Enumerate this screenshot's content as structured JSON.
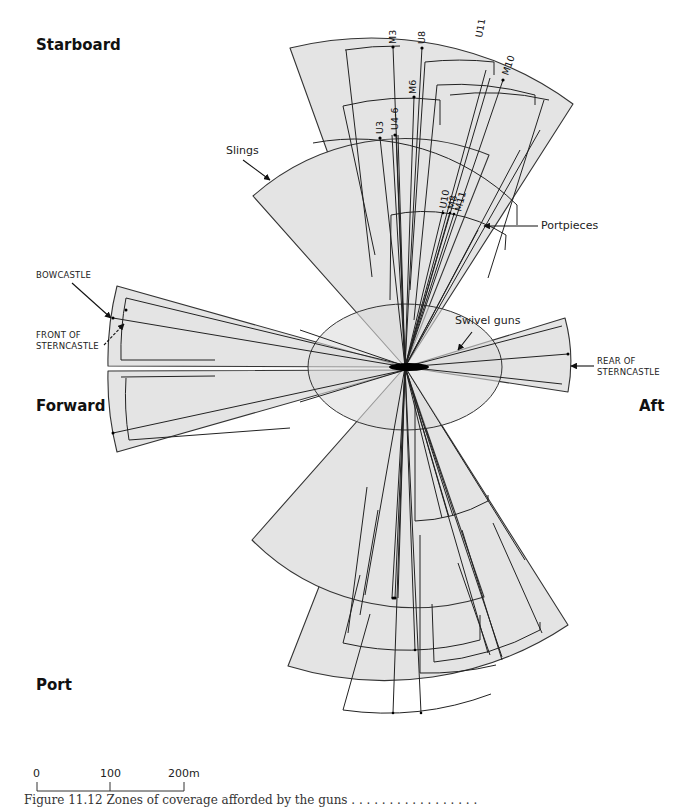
{
  "directions": {
    "starboard": "Starboard",
    "forward": "Forward",
    "aft": "Aft",
    "port": "Port"
  },
  "annotations": {
    "slings": "Slings",
    "portpieces": "Portpieces",
    "swivel_guns": "Swivel guns",
    "bowcastle": "BOWCASTLE",
    "front_of_sterncastle": "FRONT OF\nSTERNCASTLE",
    "rear_of_sterncastle": "REAR OF\nSTERNCASTLE"
  },
  "gun_labels": [
    "M3",
    "U8",
    "M6",
    "U11",
    "M10",
    "U3",
    "U4-6",
    "U10",
    "M8",
    "M11"
  ],
  "scale_bar": {
    "ticks": [
      "0",
      "100",
      "200m"
    ],
    "unit": "m"
  },
  "caption": "Figure 11.12  Zones of coverage afforded by the guns . . . . . . . . . . . . . . . . ."
}
